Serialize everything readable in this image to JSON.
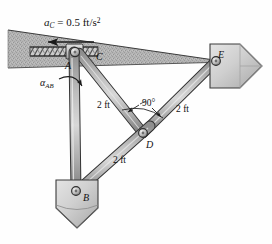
{
  "figure": {
    "background": "#ffffff"
  },
  "colors": {
    "ground_fill": "#b4b4b4",
    "ground_speckle": "#8f8f8f",
    "link_light": "#d2d2d2",
    "link_mid": "#a6a6a6",
    "link_dark": "#6e6e6e",
    "outline": "#3a3a3a",
    "block_light": "#dcdcdc",
    "block_mid": "#b8b8b8",
    "text": "#111111"
  },
  "labels": {
    "acceleration": {
      "symbol": "a",
      "subscript": "C",
      "equals": " = 0.5 ft/s",
      "exponent": "2",
      "full": "aC = 0.5 ft/s2"
    },
    "point_A": "A",
    "point_B": "B",
    "point_C": "C",
    "point_D": "D",
    "point_E": "E",
    "angular_accel": {
      "symbol": "α",
      "subscript": "AB"
    },
    "length_CD": "2 ft",
    "length_DE": "2 ft",
    "length_BD": "2 ft",
    "right_angle": "90°"
  },
  "geometry": {
    "points": {
      "A": [
        74,
        54
      ],
      "C": [
        79,
        52
      ],
      "B": [
        76,
        192
      ],
      "D": [
        143,
        133
      ],
      "E": [
        216,
        61
      ]
    },
    "ground_wedge": "8,30 228,62 8,68",
    "slot_span": [
      30,
      98
    ],
    "slot_y": 52,
    "arrow_ac": {
      "from": [
        94,
        42
      ],
      "to": [
        47,
        42
      ],
      "direction": "left"
    }
  },
  "annotations": {
    "arrow_ac_name": "acceleration-arrow",
    "alpha_arrow_name": "angular-acceleration-arrow",
    "right_angle_marker": "right-angle-arc-at-D"
  }
}
